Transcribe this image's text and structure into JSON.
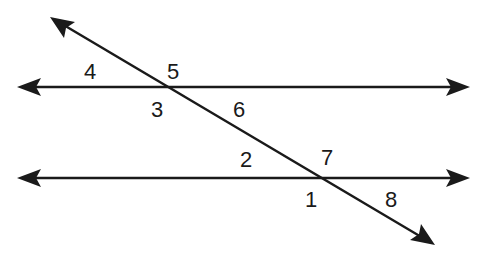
{
  "diagram": {
    "type": "parallel-lines-with-transversal",
    "stroke_color": "#1a1a1a",
    "background": "#ffffff",
    "lines": [
      {
        "name": "upper-parallel-line",
        "from": [
          17,
          87
        ],
        "to": [
          470,
          87
        ],
        "arrows": "both"
      },
      {
        "name": "lower-parallel-line",
        "from": [
          17,
          178
        ],
        "to": [
          470,
          178
        ],
        "arrows": "both"
      },
      {
        "name": "transversal",
        "from": [
          50,
          17
        ],
        "to": [
          435,
          245
        ],
        "arrows": "both"
      }
    ],
    "angle_labels": [
      {
        "id": "4",
        "text": "4",
        "x": 84,
        "y": 61
      },
      {
        "id": "5",
        "text": "5",
        "x": 167,
        "y": 61
      },
      {
        "id": "3",
        "text": "3",
        "x": 151,
        "y": 99
      },
      {
        "id": "6",
        "text": "6",
        "x": 233,
        "y": 99
      },
      {
        "id": "2",
        "text": "2",
        "x": 240,
        "y": 149
      },
      {
        "id": "7",
        "text": "7",
        "x": 321,
        "y": 147
      },
      {
        "id": "1",
        "text": "1",
        "x": 305,
        "y": 189
      },
      {
        "id": "8",
        "text": "8",
        "x": 385,
        "y": 189
      }
    ]
  }
}
